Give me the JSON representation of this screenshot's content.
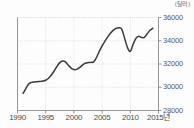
{
  "chart_data": {
    "type": "line",
    "title": "",
    "subtitle": "",
    "unit_label": "(달러)",
    "xlabel": "",
    "ylabel": "",
    "xlim": [
      1990,
      2015
    ],
    "ylim": [
      28000,
      36000
    ],
    "grid": true,
    "legend": "none",
    "line_color": "#3a3a3a",
    "axis_color": "#8a8a8a",
    "grid_color": "#d8d8d8",
    "y_ticks": [
      36000,
      34000,
      32000,
      30000,
      28000
    ],
    "y_tick_labels": [
      "36000",
      "34000",
      "32000",
      "30000",
      "28000"
    ],
    "x_ticks": [
      1990,
      1995,
      2000,
      2005,
      2010,
      2015
    ],
    "x_tick_labels": [
      "1990",
      "1995",
      "2000",
      "2005",
      "2010",
      "2015년"
    ],
    "series": [
      {
        "name": "value",
        "x": [
          1991.0,
          1991.5,
          1992.0,
          1992.5,
          1993.0,
          1993.5,
          1994.0,
          1994.5,
          1995.0,
          1995.5,
          1996.0,
          1996.5,
          1997.0,
          1997.5,
          1998.0,
          1998.5,
          1999.0,
          1999.5,
          2000.0,
          2000.5,
          2001.0,
          2001.5,
          2002.0,
          2002.5,
          2003.0,
          2003.5,
          2004.0,
          2004.5,
          2005.0,
          2005.5,
          2006.0,
          2006.5,
          2007.0,
          2007.5,
          2008.0,
          2008.5,
          2009.0,
          2009.5,
          2010.0,
          2010.5,
          2011.0,
          2011.5,
          2012.0,
          2012.5,
          2013.0,
          2013.5,
          2014.0
        ],
        "y": [
          29480,
          29900,
          30290,
          30420,
          30460,
          30480,
          30500,
          30530,
          30600,
          30780,
          31050,
          31400,
          31800,
          32120,
          32260,
          32180,
          31900,
          31650,
          31520,
          31540,
          31690,
          31900,
          32060,
          32120,
          32140,
          32180,
          32560,
          33080,
          33560,
          33960,
          34330,
          34660,
          34920,
          35060,
          35120,
          34980,
          34200,
          33420,
          33080,
          33700,
          34200,
          34380,
          34280,
          34300,
          34600,
          34900,
          35080
        ]
      }
    ]
  }
}
